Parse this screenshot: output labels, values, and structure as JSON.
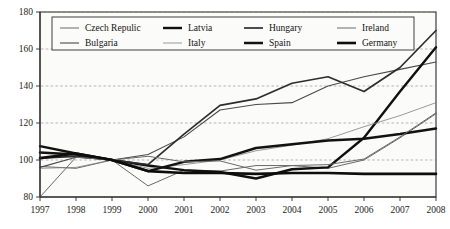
{
  "chart_data": {
    "type": "line",
    "title": "",
    "xlabel": "",
    "ylabel": "",
    "x": [
      1997,
      1998,
      1999,
      2000,
      2001,
      2002,
      2003,
      2004,
      2005,
      2006,
      2007,
      2008
    ],
    "xticklabels": [
      "1997",
      "1998",
      "1999",
      "2000",
      "2001",
      "2002",
      "2003",
      "2004",
      "2005",
      "2006",
      "2007",
      "2008"
    ],
    "yticklabels": [
      "80",
      "100",
      "120",
      "140",
      "160",
      "180"
    ],
    "yticks": [
      80,
      100,
      120,
      140,
      160,
      180
    ],
    "ylim": [
      80,
      180
    ],
    "xlim": [
      1997,
      2008
    ],
    "grid": "horizontal-dashed",
    "legend_position": "top-inside",
    "legend_columns": 4,
    "legend_rows": 2,
    "series": [
      {
        "name": "Czech Repulic",
        "style": "thin",
        "color": "#58585a",
        "width": 0.9,
        "values": [
          96.5,
          95.5,
          100,
          86,
          94.5,
          94,
          97,
          97,
          95.5,
          100,
          112,
          125
        ]
      },
      {
        "name": "Bulgaria",
        "style": "thin-medium",
        "color": "#4a4a4c",
        "width": 1.1,
        "values": [
          96,
          101.5,
          100,
          103,
          112.5,
          127,
          130,
          131,
          140,
          145,
          149,
          153
        ]
      },
      {
        "name": "Latvia",
        "style": "thick",
        "color": "#101010",
        "width": 2.4,
        "values": [
          107.5,
          103.5,
          100,
          97,
          94.5,
          93.5,
          90,
          95,
          96,
          112,
          137,
          161
        ]
      },
      {
        "name": "Italy",
        "style": "very-thin",
        "color": "#828284",
        "width": 0.8,
        "values": [
          95.5,
          96,
          100,
          95.5,
          97.5,
          100,
          105,
          108,
          111.5,
          118,
          124,
          131
        ]
      },
      {
        "name": "Hungary",
        "style": "medium",
        "color": "#2d2d2f",
        "width": 1.7,
        "values": [
          101,
          102,
          100,
          97.5,
          114,
          129.5,
          133,
          141.5,
          145,
          137,
          150,
          170
        ]
      },
      {
        "name": "Spain",
        "style": "thick",
        "color": "#121212",
        "width": 2.5,
        "values": [
          104,
          103,
          100,
          94,
          99,
          100.5,
          106.5,
          108.5,
          110.5,
          111.5,
          114,
          117
        ]
      },
      {
        "name": "Ireland",
        "style": "thin",
        "color": "#6a6a6c",
        "width": 1.0,
        "values": [
          80,
          101.5,
          100,
          102,
          99,
          99.5,
          94.5,
          97,
          97.5,
          100.5,
          112.5,
          125.5
        ]
      },
      {
        "name": "Germany",
        "style": "thick",
        "color": "#0d0d0d",
        "width": 2.6,
        "values": [
          101,
          103.5,
          100,
          94,
          93,
          93,
          92.5,
          93,
          93,
          92.5,
          92.5,
          92.5
        ]
      }
    ]
  },
  "legend": {
    "items": [
      {
        "label": "Czech Repulic"
      },
      {
        "label": "Latvia"
      },
      {
        "label": "Hungary"
      },
      {
        "label": "Ireland"
      },
      {
        "label": "Bulgaria"
      },
      {
        "label": "Italy"
      },
      {
        "label": "Spain"
      },
      {
        "label": "Germany"
      }
    ]
  }
}
